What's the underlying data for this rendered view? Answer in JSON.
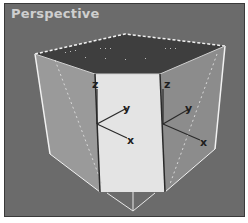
{
  "viewport": {
    "label": "Perspective",
    "colors": {
      "background": "#6b6b6b",
      "left_face": "#9a9a9a",
      "right_face": "#8f8f8f",
      "front_face": "#e4e4e4",
      "top_face": "#3e3e3e",
      "edge_highlight": "#f2f2f2"
    }
  },
  "gizmos": [
    {
      "name": "left-gizmo",
      "labels": {
        "z": "z",
        "y": "y",
        "x": "x"
      }
    },
    {
      "name": "right-gizmo",
      "labels": {
        "z": "z",
        "y": "y",
        "x": "x"
      }
    }
  ]
}
